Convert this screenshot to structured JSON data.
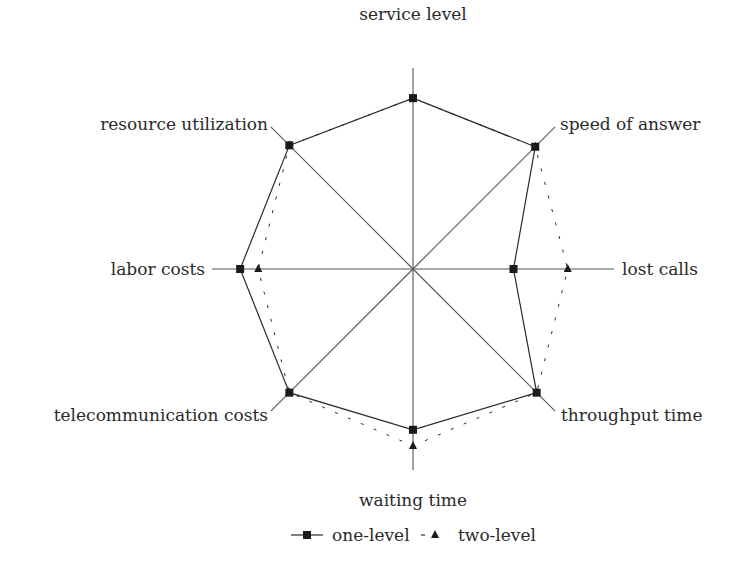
{
  "chart_data": {
    "type": "radar",
    "title": "",
    "axes": [
      "service level",
      "speed of answer",
      "lost calls",
      "throughput time",
      "waiting time",
      "telecommunication costs",
      "labor costs",
      "resource utilization"
    ],
    "range": [
      0,
      1
    ],
    "series": [
      {
        "name": "one-level",
        "style": "solid",
        "marker": "square",
        "values": [
          0.85,
          0.86,
          0.5,
          0.87,
          0.8,
          0.87,
          0.86,
          0.87
        ]
      },
      {
        "name": "two-level",
        "style": "dashed",
        "marker": "triangle",
        "values": [
          0.85,
          0.86,
          0.77,
          0.87,
          0.88,
          0.87,
          0.77,
          0.87
        ]
      }
    ],
    "legend_position": "bottom",
    "grid": false
  },
  "legend": {
    "one_level": "one-level",
    "two_level": "two-level"
  },
  "colors": {
    "line": "#2a2a2a",
    "axis": "#555555"
  }
}
